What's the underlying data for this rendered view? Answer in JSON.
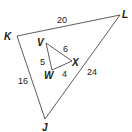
{
  "diagram": {
    "type": "similar-triangles",
    "large_triangle": {
      "vertices": [
        {
          "name": "K",
          "x": 17,
          "y": 36,
          "lx": 4,
          "ly": 40
        },
        {
          "name": "L",
          "x": 120,
          "y": 15,
          "lx": 122,
          "ly": 18
        },
        {
          "name": "J",
          "x": 45,
          "y": 119,
          "lx": 42,
          "ly": 131
        }
      ],
      "sides": [
        {
          "between": "K-L",
          "label": "20",
          "lx": 57,
          "ly": 23
        },
        {
          "between": "L-J",
          "label": "24",
          "lx": 87,
          "ly": 75
        },
        {
          "between": "K-J",
          "label": "16",
          "lx": 18,
          "ly": 84
        }
      ]
    },
    "small_triangle": {
      "vertices": [
        {
          "name": "V",
          "x": 46,
          "y": 43,
          "lx": 37,
          "ly": 46
        },
        {
          "name": "X",
          "x": 72,
          "y": 61,
          "lx": 72,
          "ly": 66
        },
        {
          "name": "W",
          "x": 52,
          "y": 70,
          "lx": 44,
          "ly": 79
        }
      ],
      "sides": [
        {
          "between": "V-X",
          "label": "6",
          "lx": 63,
          "ly": 52
        },
        {
          "between": "V-W",
          "label": "5",
          "lx": 40,
          "ly": 65
        },
        {
          "between": "W-X",
          "label": "4",
          "lx": 62,
          "ly": 77
        }
      ]
    },
    "colors": {
      "stroke": "#333333",
      "text": "#1a1a1a",
      "background": "#ffffff"
    }
  }
}
